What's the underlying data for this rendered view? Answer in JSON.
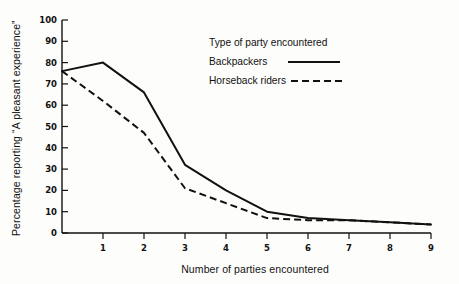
{
  "chart_data": {
    "type": "line",
    "title": "",
    "xlabel": "Number of parties encountered",
    "ylabel": "Percentage reporting “A pleasant experience”",
    "xlim": [
      0,
      9
    ],
    "ylim": [
      0,
      100
    ],
    "grid": false,
    "legend_position": "top-right",
    "legend_title": "Type of party encountered",
    "x_ticks": [
      "1",
      "2",
      "3",
      "4",
      "5",
      "6",
      "7",
      "8",
      "9"
    ],
    "y_ticks": [
      "0",
      "10",
      "20",
      "30",
      "40",
      "50",
      "60",
      "70",
      "80",
      "90",
      "100"
    ],
    "x": [
      0,
      1,
      2,
      3,
      4,
      5,
      6,
      7,
      8,
      9
    ],
    "series": [
      {
        "name": "Backpackers",
        "style": "solid",
        "values": [
          76,
          80,
          66,
          32,
          20,
          10,
          7,
          6,
          5,
          4
        ]
      },
      {
        "name": "Horseback riders",
        "style": "dashed",
        "values": [
          76,
          62,
          47,
          21,
          14,
          7,
          6,
          6,
          5,
          4
        ]
      }
    ]
  },
  "legend": {
    "title": "Type of party encountered",
    "entries": [
      {
        "label": "Backpackers",
        "style": "solid"
      },
      {
        "label": "Horseback riders",
        "style": "dashed"
      }
    ]
  },
  "axes": {
    "x_title": "Number of parties encountered",
    "y_title": "Percentage reporting “A pleasant experience”"
  },
  "colors": {
    "ink": "#111111",
    "background": "#fdfdfc"
  }
}
